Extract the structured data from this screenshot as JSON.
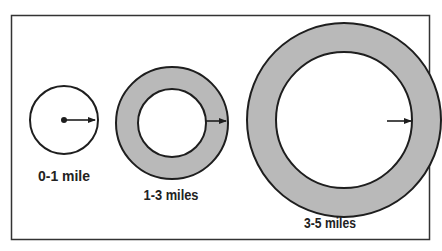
{
  "diagram": {
    "colors": {
      "ring_fill": "#b9b9b9",
      "stroke": "#1e1e1e",
      "background": "#ffffff"
    },
    "zones": [
      {
        "label": "0-1 mile",
        "cx": 64,
        "cy": 120,
        "outer_r": 34,
        "inner_r": 0,
        "filled": false
      },
      {
        "label": "1-3 miles",
        "cx": 172,
        "cy": 123,
        "outer_r": 56,
        "inner_r": 34,
        "filled": true
      },
      {
        "label": "3-5 miles",
        "cx": 344,
        "cy": 120,
        "outer_r": 97,
        "inner_r": 68,
        "filled": true
      }
    ]
  }
}
